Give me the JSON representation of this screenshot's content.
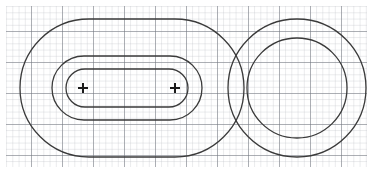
{
  "figure": {
    "description": "Nested stadium-shaped closed contours enclosing two point markers on the left, and two concentric circular contours on the right, drawn over a fine square grid.",
    "background_color": "#ffffff",
    "canvas": {
      "width": 373,
      "height": 173
    }
  },
  "grid": {
    "name": "graph-paper-grid",
    "minor_spacing_px": 6.2,
    "major_every_n_cells": 5,
    "minor_color": "#b9bcc4",
    "major_color": "#6f737c",
    "minor_width_px": 0.6,
    "major_width_px": 1.0,
    "x_start": 6,
    "y_start": 6,
    "x_end": 367,
    "y_end": 167,
    "columns": 58,
    "rows": 26
  },
  "contours": {
    "stroke_color": "#3a3a3a",
    "stroke_width_px": 1.3,
    "fill": "none",
    "stadium_group": {
      "label": "nested stadium contours",
      "count": 3,
      "shapes": [
        {
          "name": "stadium-outer",
          "x": 20,
          "y": 19,
          "width": 224,
          "height": 138,
          "radius": 69
        },
        {
          "name": "stadium-middle",
          "x": 52,
          "y": 56,
          "width": 150,
          "height": 64,
          "radius": 32
        },
        {
          "name": "stadium-inner",
          "x": 66,
          "y": 69,
          "width": 122,
          "height": 38,
          "radius": 19
        }
      ]
    },
    "circle_group": {
      "label": "concentric circular contours",
      "count": 2,
      "center_x": 297,
      "center_y": 88,
      "shapes": [
        {
          "name": "circle-outer",
          "radius": 69
        },
        {
          "name": "circle-inner",
          "radius": 50
        }
      ]
    }
  },
  "markers": {
    "glyph": "plus-cross",
    "stroke_color": "#1a1a1a",
    "stroke_width_px": 2.0,
    "arm_length_px": 5,
    "points": [
      {
        "name": "marker-left",
        "x": 83,
        "y": 88,
        "label": "+"
      },
      {
        "name": "marker-right",
        "x": 175,
        "y": 88,
        "label": "+"
      }
    ]
  },
  "chart_data": {
    "type": "line",
    "xlabel": "",
    "ylabel": "",
    "xlim": [
      0,
      373
    ],
    "ylim": [
      0,
      173
    ],
    "grid": true,
    "legend": "none",
    "annotations": [
      "+",
      "+"
    ],
    "series": [
      {
        "name": "stadium-outer",
        "shape": "stadium",
        "center": [
          132,
          88
        ],
        "half_length": 112,
        "half_height": 69,
        "corner_radius": 69
      },
      {
        "name": "stadium-middle",
        "shape": "stadium",
        "center": [
          127,
          88
        ],
        "half_length": 75,
        "half_height": 32,
        "corner_radius": 32
      },
      {
        "name": "stadium-inner",
        "shape": "stadium",
        "center": [
          127,
          88
        ],
        "half_length": 61,
        "half_height": 19,
        "corner_radius": 19
      },
      {
        "name": "circle-outer",
        "shape": "circle",
        "center": [
          297,
          88
        ],
        "radius": 69
      },
      {
        "name": "circle-inner",
        "shape": "circle",
        "center": [
          297,
          88
        ],
        "radius": 50
      }
    ],
    "point_markers": [
      {
        "name": "source-left",
        "x": 83,
        "y": 88
      },
      {
        "name": "source-right",
        "x": 175,
        "y": 88
      }
    ]
  }
}
